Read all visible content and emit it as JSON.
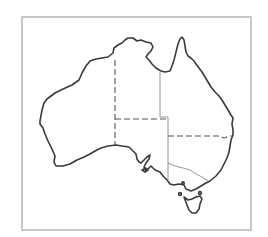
{
  "map": {
    "subject": "Australia",
    "style": "outline map with state borders",
    "colors": {
      "frame": "#c8c8c8",
      "coastline": "#3a3a3a",
      "borders": "#555555",
      "background": "#ffffff"
    },
    "regions": [
      {
        "id": "WA",
        "name": "Western Australia"
      },
      {
        "id": "NT",
        "name": "Northern Territory"
      },
      {
        "id": "SA",
        "name": "South Australia"
      },
      {
        "id": "QLD",
        "name": "Queensland"
      },
      {
        "id": "NSW",
        "name": "New South Wales"
      },
      {
        "id": "VIC",
        "name": "Victoria"
      },
      {
        "id": "TAS",
        "name": "Tasmania"
      }
    ]
  }
}
